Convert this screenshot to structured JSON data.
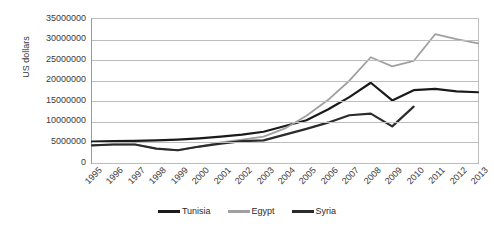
{
  "chart_data": {
    "type": "line",
    "title": "",
    "xlabel": "",
    "ylabel": "US dollars",
    "ylim": [
      0,
      35000000
    ],
    "ytick_step": 5000000,
    "grid": true,
    "legend_position": "bottom",
    "categories": [
      "1995",
      "1996",
      "1997",
      "1998",
      "1999",
      "2000",
      "2001",
      "2002",
      "2003",
      "2004",
      "2005",
      "2006",
      "2007",
      "2008",
      "2009",
      "2010",
      "2011",
      "2012",
      "2013"
    ],
    "yticks": [
      "0",
      "5000000",
      "10000000",
      "15000000",
      "20000000",
      "25000000",
      "30000000",
      "35000000"
    ],
    "series": [
      {
        "name": "Tunisia",
        "color": "#1a1a1a",
        "values": [
          5200000,
          5300000,
          5400000,
          5500000,
          5700000,
          6000000,
          6400000,
          6900000,
          7600000,
          9000000,
          10400000,
          13000000,
          16000000,
          19500000,
          15200000,
          17700000,
          18000000,
          17400000,
          17200000
        ]
      },
      {
        "name": "Egypt",
        "color": "#a0a0a0",
        "values": [
          4300000,
          4500000,
          4500000,
          3500000,
          3100000,
          4000000,
          5000000,
          5700000,
          6400000,
          8400000,
          11500000,
          15300000,
          20000000,
          25700000,
          23500000,
          24800000,
          31300000,
          30100000,
          29100000
        ]
      },
      {
        "name": "Syria",
        "color": "#2b2b2b",
        "values": [
          4300000,
          4500000,
          4500000,
          3500000,
          3100000,
          4000000,
          4700000,
          5300000,
          5500000,
          6900000,
          8300000,
          9800000,
          11600000,
          12000000,
          8900000,
          13700000,
          null,
          null,
          null
        ]
      }
    ]
  }
}
